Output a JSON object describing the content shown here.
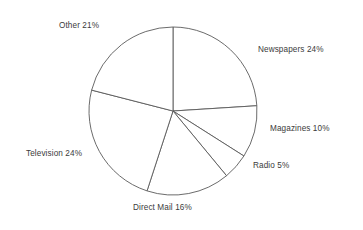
{
  "chart_data": {
    "type": "pie",
    "title": "",
    "labels": [
      "Newspapers",
      "Magazines",
      "Radio",
      "Direct Mail",
      "Television",
      "Other"
    ],
    "values": [
      24,
      10,
      5,
      16,
      24,
      21
    ],
    "unit": "%",
    "start_angle_deg": 0,
    "direction": "clockwise",
    "legend": "none",
    "grid": false,
    "slice_fill": "#ffffff",
    "slice_stroke": "#5a5a5a",
    "label_color": "#3b3b3b",
    "background": "#ffffff",
    "center": {
      "x": 173,
      "y": 111
    },
    "radius": 84,
    "slices": [
      {
        "label": "Newspapers",
        "value": 24,
        "display": "Newspapers 24%",
        "start_deg": 0,
        "end_deg": 86.4
      },
      {
        "label": "Magazines",
        "value": 10,
        "display": "Magazines 10%",
        "start_deg": 86.4,
        "end_deg": 122.4
      },
      {
        "label": "Radio",
        "value": 5,
        "display": "Radio 5%",
        "start_deg": 122.4,
        "end_deg": 140.4
      },
      {
        "label": "Direct Mail",
        "value": 16,
        "display": "Direct Mail 16%",
        "start_deg": 140.4,
        "end_deg": 198.0
      },
      {
        "label": "Television",
        "value": 24,
        "display": "Television 24%",
        "start_deg": 198.0,
        "end_deg": 284.4
      },
      {
        "label": "Other",
        "value": 21,
        "display": "Other 21%",
        "start_deg": 284.4,
        "end_deg": 360.0
      }
    ]
  },
  "labels": {
    "other": "Other 21%",
    "newspapers": "Newspapers 24%",
    "magazines": "Magazines 10%",
    "radio": "Radio 5%",
    "television": "Television 24%",
    "direct_mail": "Direct Mail 16%"
  }
}
